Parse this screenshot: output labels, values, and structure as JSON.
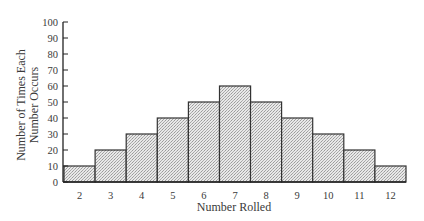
{
  "chart_data": {
    "type": "bar",
    "title": "",
    "xlabel": "Number Rolled",
    "ylabel": [
      "Number of Times Each",
      "Number Occurs"
    ],
    "categories": [
      "2",
      "3",
      "4",
      "5",
      "6",
      "7",
      "8",
      "9",
      "10",
      "11",
      "12"
    ],
    "values": [
      10,
      20,
      30,
      40,
      50,
      60,
      50,
      40,
      30,
      20,
      10
    ],
    "ylim": [
      0,
      100
    ],
    "yticks": [
      0,
      10,
      20,
      30,
      40,
      50,
      60,
      70,
      80,
      90,
      100
    ],
    "grid": false,
    "legend": null,
    "bar_fill": "#dcdcdc",
    "bar_stroke": "#333333"
  }
}
